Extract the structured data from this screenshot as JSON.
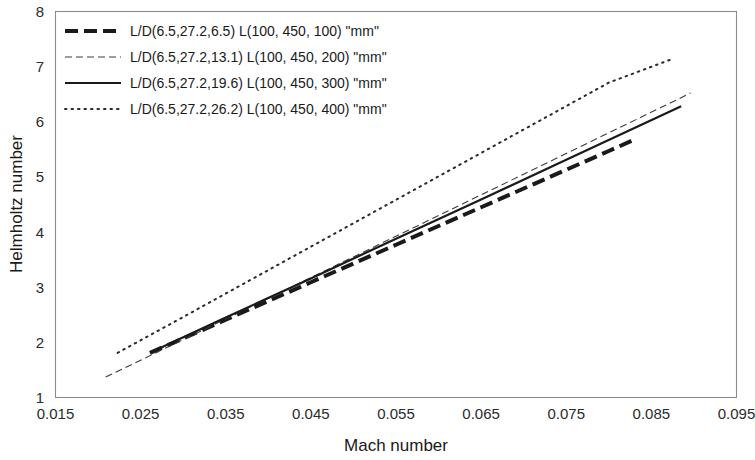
{
  "chart_data": {
    "type": "line",
    "title": "",
    "xlabel": "Mach number",
    "ylabel": "Helmholtz number",
    "xlim": [
      0.015,
      0.095
    ],
    "ylim": [
      1,
      8
    ],
    "xticks": [
      "0.015",
      "0.025",
      "0.035",
      "0.045",
      "0.055",
      "0.065",
      "0.075",
      "0.085",
      "0.095"
    ],
    "xtick_values": [
      0.015,
      0.025,
      0.035,
      0.045,
      0.055,
      0.065,
      0.075,
      0.085,
      0.095
    ],
    "yticks": [
      "1",
      "2",
      "3",
      "4",
      "5",
      "6",
      "7",
      "8"
    ],
    "ytick_values": [
      1,
      2,
      3,
      4,
      5,
      6,
      7,
      8
    ],
    "grid": false,
    "legend_position": "top-left",
    "series": [
      {
        "name": "L/D(6.5,27.2,6.5)   L(100, 450, 100) \"mm\"",
        "style": "thick-dashed",
        "color": "#1a1a1a",
        "width": 4.0,
        "dash": "13,6",
        "x": [
          0.0261,
          0.03,
          0.035,
          0.04,
          0.045,
          0.05,
          0.055,
          0.06,
          0.065,
          0.07,
          0.075,
          0.08,
          0.0829
        ],
        "y": [
          1.81,
          2.07,
          2.41,
          2.75,
          3.09,
          3.43,
          3.77,
          4.11,
          4.45,
          4.79,
          5.13,
          5.47,
          5.67
        ]
      },
      {
        "name": "L/D(6.5,27.2,13.1) L(100, 450, 200) \"mm\"",
        "style": "thin-dashed",
        "color": "#3c3c3c",
        "width": 1.1,
        "dash": "7,4",
        "x": [
          0.0209,
          0.03,
          0.04,
          0.05,
          0.06,
          0.07,
          0.08,
          0.0896
        ],
        "y": [
          1.37,
          2.05,
          2.8,
          3.55,
          4.3,
          5.05,
          5.8,
          6.52
        ]
      },
      {
        "name": "L/D(6.5,27.2,19.6) L(100, 450, 300) \"mm\"",
        "style": "solid",
        "color": "#1a1a1a",
        "width": 2.2,
        "dash": "none",
        "x": [
          0.0261,
          0.035,
          0.045,
          0.055,
          0.065,
          0.075,
          0.0885
        ],
        "y": [
          1.81,
          2.45,
          3.16,
          3.88,
          4.59,
          5.31,
          6.28
        ]
      },
      {
        "name": "L/D(6.5,27.2,26.2) L(100, 450, 400) \"mm\"",
        "style": "dotted",
        "color": "#2b2b2b",
        "width": 2.0,
        "dash": "1.5,5",
        "x": [
          0.0223,
          0.03,
          0.04,
          0.05,
          0.06,
          0.07,
          0.08,
          0.0873
        ],
        "y": [
          1.81,
          2.46,
          3.31,
          4.16,
          5.01,
          5.86,
          6.71,
          7.13
        ]
      }
    ]
  },
  "legend": {
    "entries": [
      {
        "label": "L/D(6.5,27.2,6.5)   L(100, 450, 100) \"mm\"",
        "style": "thick-dashed"
      },
      {
        "label": "L/D(6.5,27.2,13.1) L(100, 450, 200) \"mm\"",
        "style": "thin-dashed"
      },
      {
        "label": "L/D(6.5,27.2,19.6) L(100, 450, 300) \"mm\"",
        "style": "solid"
      },
      {
        "label": "L/D(6.5,27.2,26.2) L(100, 450, 400) \"mm\"",
        "style": "dotted"
      }
    ]
  }
}
